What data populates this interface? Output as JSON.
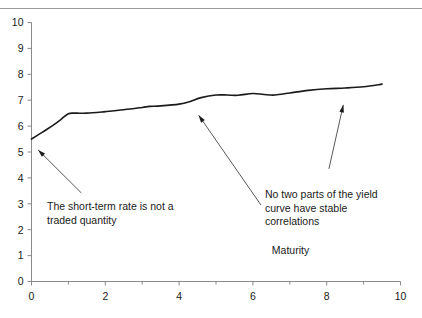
{
  "chart_data": {
    "type": "line",
    "title": "",
    "subtitle": "",
    "xlabel": "Maturity",
    "ylabel": "",
    "xlim": [
      0,
      10
    ],
    "ylim": [
      0,
      10
    ],
    "xticks": [
      0,
      2,
      4,
      6,
      8,
      10
    ],
    "xtick_labels": [
      "0",
      "2",
      "4",
      "6",
      "8",
      "10"
    ],
    "yticks": [
      0,
      1,
      2,
      3,
      4,
      5,
      6,
      7,
      8,
      9,
      10
    ],
    "ytick_labels": [
      "0",
      "1",
      "2",
      "3",
      "4",
      "5",
      "6",
      "7",
      "8",
      "9",
      "10"
    ],
    "xminor_ticks": [
      1,
      3,
      5,
      7,
      9
    ],
    "grid": false,
    "legend": false,
    "legend_position": "none",
    "series": [
      {
        "name": "yield curve",
        "color": "#1a1a1a",
        "linewidth": 1.6,
        "x": [
          0.0,
          0.2,
          0.4,
          0.6,
          0.8,
          1.0,
          1.2,
          1.5,
          2.0,
          2.5,
          3.0,
          3.2,
          3.5,
          4.0,
          4.3,
          4.6,
          5.0,
          5.3,
          5.6,
          6.0,
          6.3,
          6.6,
          7.0,
          7.5,
          8.0,
          8.5,
          9.0,
          9.5
        ],
        "y": [
          5.5,
          5.68,
          5.86,
          6.05,
          6.26,
          6.48,
          6.5,
          6.5,
          6.56,
          6.63,
          6.72,
          6.76,
          6.78,
          6.85,
          6.95,
          7.1,
          7.2,
          7.2,
          7.19,
          7.26,
          7.22,
          7.2,
          7.28,
          7.38,
          7.44,
          7.47,
          7.52,
          7.62
        ]
      }
    ],
    "annotations": [
      {
        "id": "annot-0",
        "text": "The short-term rate is not a\ntraded quantity",
        "text_x": 0.6,
        "text_y": 2.85,
        "arrow_from_x": 1.35,
        "arrow_from_y": 3.42,
        "arrow_to_x": 0.18,
        "arrow_to_y": 5.08
      },
      {
        "id": "annot-1",
        "text": "No two parts of the yield\ncurve have stable\ncorrelations",
        "text_x": 6.35,
        "text_y": 3.36,
        "arrow_from_x": 6.22,
        "arrow_from_y": 2.95,
        "arrow_to_x": 4.53,
        "arrow_to_y": 6.42
      },
      {
        "id": "annot-2",
        "text": "",
        "arrow_from_x": 8.06,
        "arrow_from_y": 4.35,
        "arrow_to_x": 8.45,
        "arrow_to_y": 6.82
      }
    ]
  },
  "axis": {
    "x_title": "Maturity",
    "x_title_x": 7.02,
    "x_title_y": 1.05
  },
  "colors": {
    "line": "#1a1a1a",
    "axis": "#8a8a8a",
    "rule": "#9a9a9a",
    "text": "#1a1a1a",
    "background": "#ffffff"
  }
}
